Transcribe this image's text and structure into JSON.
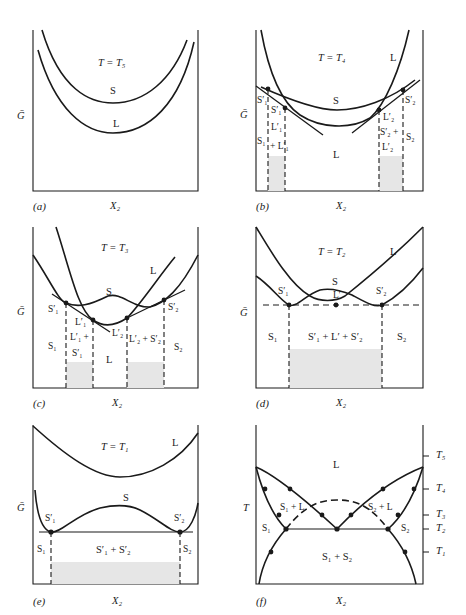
{
  "figure": {
    "panels": [
      {
        "id": "a",
        "tag": "(a)",
        "xlabel": "X₂",
        "ylabel": "Ḡ",
        "title": "T = T₅",
        "curve_labels": {
          "solid": "S",
          "liquid": "L"
        }
      },
      {
        "id": "b",
        "tag": "(b)",
        "xlabel": "X₂",
        "ylabel": "Ḡ",
        "title": "T = T₄",
        "curve_labels": {
          "solid": "S",
          "liquid_top": "L",
          "liquid_region": "L"
        },
        "points": {
          "s1p_a": "S′₁",
          "s1p_b": "S′₁",
          "l1p": "L′₁",
          "l2p": "L′₂",
          "s2p": "S′₂"
        },
        "regions": {
          "s1": "S₁",
          "plus_l1": "+ L′₁",
          "s2plus": "S′₂ +",
          "l2p": "L′₂",
          "s2": "S₂"
        }
      },
      {
        "id": "c",
        "tag": "(c)",
        "xlabel": "X₂",
        "ylabel": "Ḡ",
        "title": "T = T₃",
        "curve_labels": {
          "solid": "S",
          "liquid": "L",
          "liquid_region": "L"
        },
        "points": {
          "s1p": "S′₁",
          "l1p": "L′₁",
          "l2p": "L′₂",
          "s2p": "S′₂"
        },
        "regions": {
          "s1": "S₁",
          "l1plus": "L′₁ +",
          "s1p": "S′₁",
          "l2ps2p": "L′₂ + S′₂",
          "s2": "S₂"
        }
      },
      {
        "id": "d",
        "tag": "(d)",
        "xlabel": "X₂",
        "ylabel": "Ḡ",
        "title": "T = T₂",
        "curve_labels": {
          "solid": "S",
          "liquid": "L"
        },
        "points": {
          "s1p": "S′₁",
          "lp": "L′",
          "s2p": "S′₂"
        },
        "regions": {
          "s1": "S₁",
          "three": "S′₁ + L′ + S′₂",
          "s2": "S₂"
        }
      },
      {
        "id": "e",
        "tag": "(e)",
        "xlabel": "X₂",
        "ylabel": "Ḡ",
        "title": "T = T₁",
        "curve_labels": {
          "solid": "S",
          "liquid": "L"
        },
        "points": {
          "s1p": "S′₁",
          "s2p": "S′₂"
        },
        "regions": {
          "s1": "S₁",
          "two": "S′₁ + S′₂",
          "s2": "S₂"
        }
      },
      {
        "id": "f",
        "tag": "(f)",
        "xlabel": "X₂",
        "ylabel": "T",
        "regions": {
          "liquid": "L",
          "s1l": "S₁ + L",
          "s2l": "S₂ + L",
          "s1": "S₁",
          "s2": "S₂",
          "s1s2": "S₁ + S₂"
        },
        "temperature_ticks": [
          "T₅",
          "T₄",
          "T₃",
          "T₂",
          "T₁"
        ]
      }
    ]
  },
  "colors": {
    "ink": "#1a1a1a",
    "shade": "#e6e6e6",
    "background": "#ffffff"
  }
}
